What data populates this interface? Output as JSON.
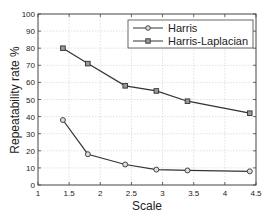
{
  "chart_data": {
    "type": "line",
    "title": "",
    "xlabel": "Scale",
    "ylabel": "Repeatability rate %",
    "xlim": [
      1,
      4.5
    ],
    "ylim": [
      0,
      100
    ],
    "xticks": [
      1,
      1.5,
      2,
      2.5,
      3,
      3.5,
      4,
      4.5
    ],
    "xtick_labels": [
      "1",
      "1.5",
      "2",
      "2.5",
      "3",
      "3.5",
      "4",
      "4.5"
    ],
    "yticks": [
      0,
      10,
      20,
      30,
      40,
      50,
      60,
      70,
      80,
      90,
      100
    ],
    "ytick_labels": [
      "0",
      "10",
      "20",
      "30",
      "40",
      "50",
      "60",
      "70",
      "80",
      "90",
      "100"
    ],
    "grid": true,
    "legend_position": "upper right",
    "x": [
      1.4,
      1.8,
      2.4,
      2.9,
      3.4,
      4.4
    ],
    "series": [
      {
        "name": "Harris",
        "marker": "circle",
        "color": "#333333",
        "values": [
          38,
          18,
          12,
          9,
          8.5,
          8
        ]
      },
      {
        "name": "Harris-Laplacian",
        "marker": "square",
        "color": "#333333",
        "values": [
          80,
          71,
          58,
          55,
          49,
          42
        ]
      }
    ]
  },
  "legend": {
    "items": [
      {
        "label": "Harris"
      },
      {
        "label": "Harris-Laplacian"
      }
    ]
  },
  "axes": {
    "xlabel": "Scale",
    "ylabel": "Repeatability rate %"
  }
}
